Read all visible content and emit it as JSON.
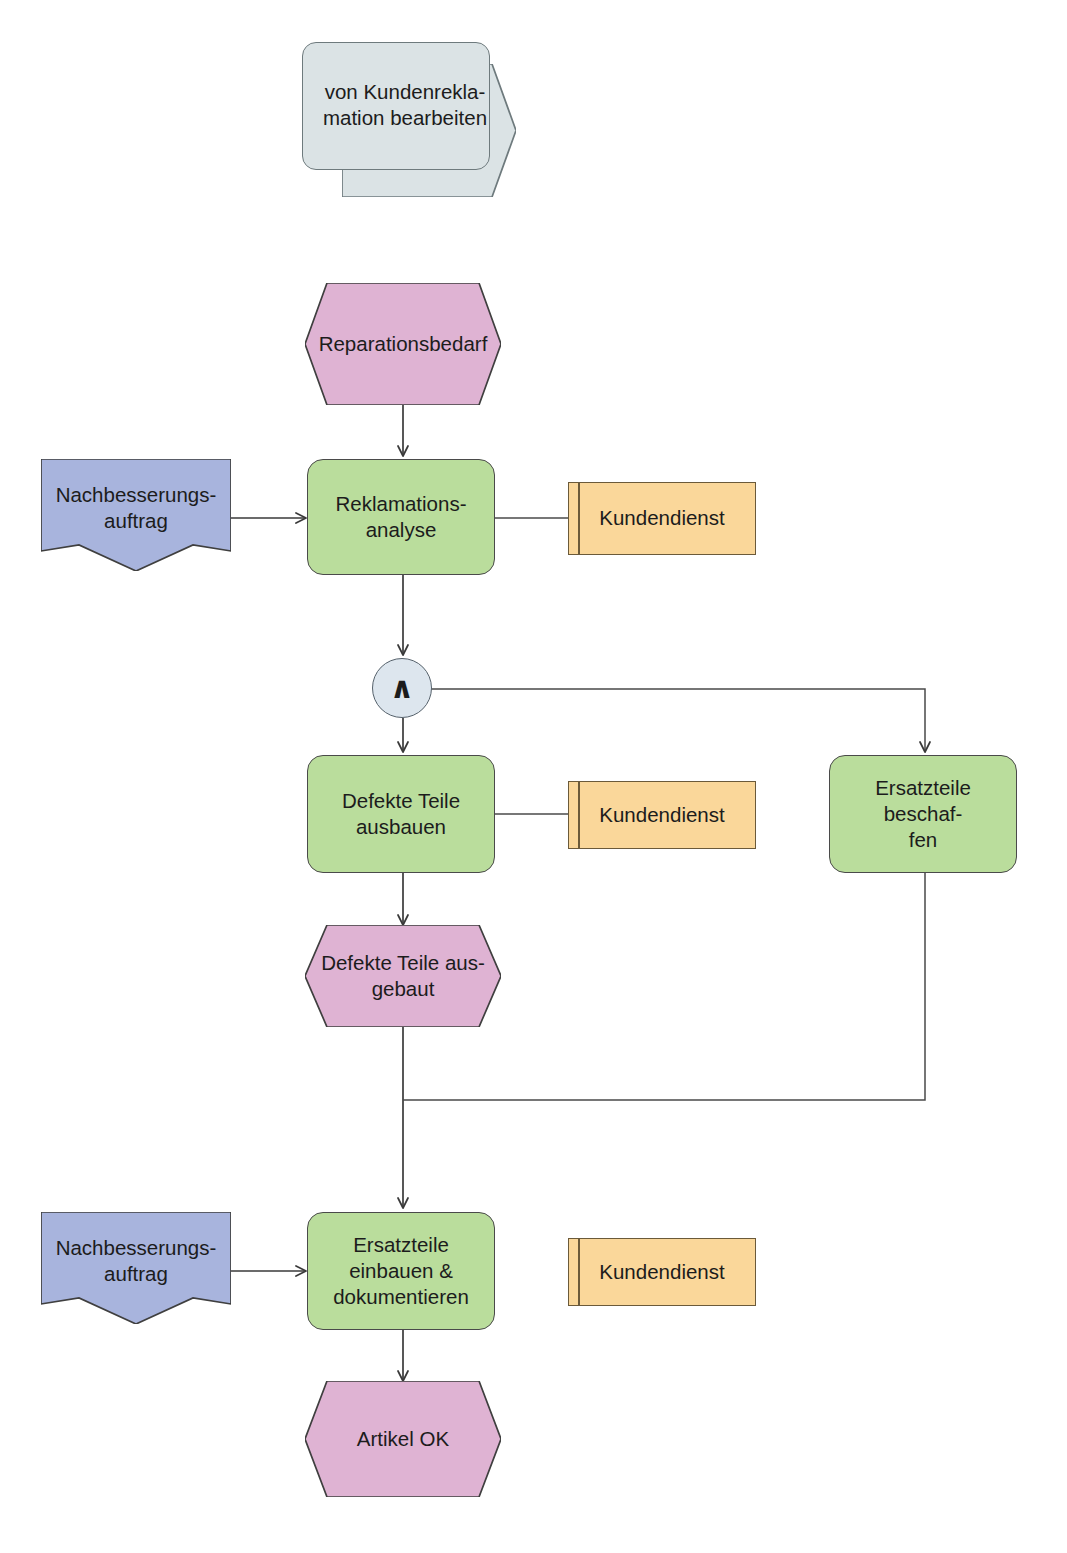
{
  "page": {
    "clipped_heading": "montieren und verbessern.",
    "width": 1067,
    "height": 1553
  },
  "colors": {
    "function_fill": "#badd9c",
    "event_fill": "#dfb3d3",
    "org_fill": "#fad79a",
    "document_fill": "#a8b4dd",
    "interface_fill": "#dbe3e5",
    "connector_fill": "#dde6ee",
    "line": "#464646"
  },
  "nodes": {
    "process_interface": {
      "type": "process-interface",
      "label": "von Kundenrekla-\nmation bearbeiten"
    },
    "event_reparationsbedarf": {
      "type": "event",
      "label": "Reparationsbedarf"
    },
    "doc_nachbesserung_1": {
      "type": "document",
      "label": "Nachbesserungs-\nauftrag"
    },
    "fn_reklamationsanalyse": {
      "type": "function",
      "label": "Reklamations-\nanalyse"
    },
    "org_kundendienst_1": {
      "type": "organization-unit",
      "label": "Kundendienst"
    },
    "connector_and": {
      "type": "connector",
      "operator": "AND",
      "symbol": "∧"
    },
    "fn_defekte_teile_ausbauen": {
      "type": "function",
      "label": "Defekte Teile\nausbauen"
    },
    "org_kundendienst_2": {
      "type": "organization-unit",
      "label": "Kundendienst"
    },
    "fn_ersatzteile_beschaffen": {
      "type": "function",
      "label": "Ersatzteile beschaf-\nfen"
    },
    "event_defekte_teile_ausgebaut": {
      "type": "event",
      "label": "Defekte Teile aus-\ngebaut"
    },
    "doc_nachbesserung_2": {
      "type": "document",
      "label": "Nachbesserungs-\nauftrag"
    },
    "fn_ersatzteile_einbauen": {
      "type": "function",
      "label": "Ersatzteile\neinbauen &\ndokumentieren"
    },
    "org_kundendienst_3": {
      "type": "organization-unit",
      "label": "Kundendienst"
    },
    "event_artikel_ok": {
      "type": "event",
      "label": "Artikel OK"
    }
  }
}
